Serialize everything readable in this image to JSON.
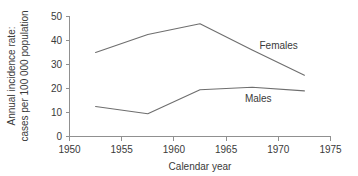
{
  "chart_data": {
    "type": "line",
    "title": "",
    "xlabel": "Calendar year",
    "ylabel": "Annual incidence rate: cases per 100 000 population",
    "ylabel_line1": "Annual incidence rate:",
    "ylabel_line2": "cases per 100 000 population",
    "x": [
      1952.5,
      1957.5,
      1962.5,
      1967.5,
      1972.5
    ],
    "xlim": [
      1950,
      1975
    ],
    "ylim": [
      0,
      50
    ],
    "xticks": [
      1950,
      1955,
      1960,
      1965,
      1970,
      1975
    ],
    "xtick_labels": [
      "1950",
      "1955",
      "1960",
      "1965",
      "1970",
      "1975"
    ],
    "yticks": [
      0,
      10,
      20,
      30,
      40,
      50
    ],
    "ytick_labels": [
      "0",
      "10",
      "20",
      "30",
      "40",
      "50"
    ],
    "grid": false,
    "legend_position": "inline-annotation",
    "series": [
      {
        "name": "Females",
        "values": [
          35,
          42.5,
          47,
          36,
          25.5
        ],
        "color": "#6e6e6e",
        "label_x": 1968.2,
        "label_y": 36.5
      },
      {
        "name": "Males",
        "values": [
          12.5,
          9.5,
          19.5,
          20.5,
          19
        ],
        "color": "#6e6e6e",
        "label_x": 1966.8,
        "label_y": 14.5
      }
    ],
    "annotations": [
      "Females",
      "Males"
    ],
    "colors": {
      "background": "#ffffff",
      "axis": "#909090",
      "line": "#6e6e6e",
      "text": "#3a3a3a"
    }
  }
}
